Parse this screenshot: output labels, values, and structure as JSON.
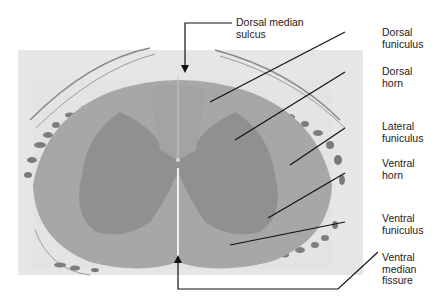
{
  "figure": {
    "labels": [
      {
        "id": "dorsal-median-sulcus",
        "line1": "Dorsal median",
        "line2": "sulcus",
        "line3": ""
      },
      {
        "id": "dorsal-funiculus",
        "line1": "Dorsal",
        "line2": "funiculus",
        "line3": ""
      },
      {
        "id": "dorsal-horn",
        "line1": "Dorsal",
        "line2": "horn",
        "line3": ""
      },
      {
        "id": "lateral-funiculus",
        "line1": "Lateral",
        "line2": "funiculus",
        "line3": ""
      },
      {
        "id": "ventral-horn",
        "line1": "Ventral",
        "line2": "horn",
        "line3": ""
      },
      {
        "id": "ventral-funiculus",
        "line1": "Ventral",
        "line2": "funiculus",
        "line3": ""
      },
      {
        "id": "ventral-median-fissure",
        "line1": "Ventral",
        "line2": "median",
        "line3": "fissure"
      }
    ],
    "colors": {
      "background": "#ffffff",
      "white_matter": "#a9a9a9",
      "gray_matter": "#8e8e8e",
      "meninges": "#e4e4e4",
      "leader_line": "#111111"
    }
  }
}
